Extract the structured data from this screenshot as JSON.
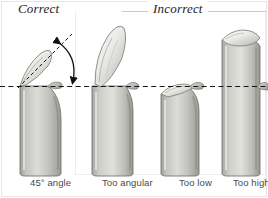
{
  "figure": {
    "title_correct": "Correct",
    "title_incorrect": "Incorrect",
    "reference_line": "horizontal dashed bud line",
    "colors": {
      "stem_light": "#d8d8d6",
      "stem_mid": "#b4b4b0",
      "stem_dark": "#8f8f8c",
      "outline": "#6f6f6c",
      "dashed_line": "#1a1a1a",
      "caption_text": "#4a4a4a",
      "heading_text": "#1d1d1d",
      "frame": "#e7e7e7"
    }
  },
  "examples": [
    {
      "id": "correct-45",
      "caption": "45° angle",
      "group": "Correct",
      "cut_angle_degrees": 45,
      "cut_height": "just above bud",
      "annotation": "dashed 45° guide line with curved double-headed angle arrow"
    },
    {
      "id": "too-angular",
      "caption": "Too angular",
      "group": "Incorrect",
      "cut_angle_degrees": 75,
      "cut_height": "very long sloping face",
      "annotation": "none"
    },
    {
      "id": "too-low",
      "caption": "Too low",
      "group": "Incorrect",
      "cut_angle_degrees": 30,
      "cut_height": "below the bud",
      "annotation": "none"
    },
    {
      "id": "too-high",
      "caption": "Too high",
      "group": "Incorrect",
      "cut_angle_degrees": 15,
      "cut_height": "far above the bud",
      "annotation": "none"
    }
  ]
}
